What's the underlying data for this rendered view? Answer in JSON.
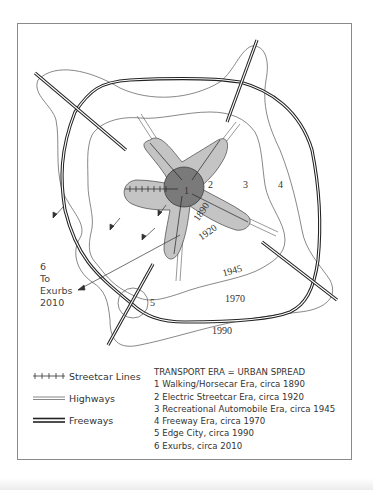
{
  "diagram": {
    "title": "Transport Era = Urban Spread",
    "map_labels": {
      "zone_1": "1",
      "zone_2": "2",
      "zone_3": "3",
      "zone_4": "4",
      "zone_5": "5",
      "year_1890": "1890",
      "year_1920": "1920",
      "year_1945": "1945",
      "year_1970": "1970",
      "year_1990": "1990"
    },
    "exurb_label": {
      "number": "6",
      "line1": "To",
      "line2": "Exurbs",
      "year": "2010"
    },
    "colors": {
      "core": "#7a7a7a",
      "streetcar_zone": "#c4c4c4",
      "line": "#2a2a2a",
      "contour": "#555555",
      "frame": "#8a8a8a"
    }
  },
  "legend": {
    "symbols": [
      {
        "id": "streetcar",
        "label": "Streetcar Lines",
        "symbol": "tick-line"
      },
      {
        "id": "highways",
        "label": "Highways",
        "symbol": "double-thin-line"
      },
      {
        "id": "freeways",
        "label": "Freeways",
        "symbol": "double-thick-line"
      }
    ],
    "eras_title": "TRANSPORT ERA = URBAN SPREAD",
    "eras": [
      "1 Walking/Horsecar Era, circa 1890",
      "2 Electric Streetcar Era, circa 1920",
      "3 Recreational Automobile Era, circa 1945",
      "4 Freeway Era, circa 1970",
      "5 Edge City, circa 1990",
      "6 Exurbs, circa 2010"
    ]
  }
}
